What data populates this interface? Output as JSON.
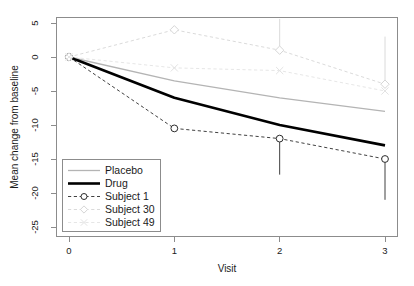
{
  "chart_data": {
    "type": "line",
    "title": "",
    "xlabel": "Visit",
    "ylabel": "Mean change from baseline",
    "x": [
      0,
      1,
      2,
      3
    ],
    "xticklabels": [
      "0",
      "1",
      "2",
      "3"
    ],
    "yticklabels": [
      "5",
      "0",
      "-5",
      "-10",
      "-15",
      "-20",
      "-25"
    ],
    "yticks": [
      5,
      0,
      -5,
      -10,
      -15,
      -20,
      -25
    ],
    "xlim": [
      -0.18,
      3.18
    ],
    "ylim": [
      -26.5,
      6.5
    ],
    "grid": false,
    "legend_position": "bottom-left-inside",
    "series": [
      {
        "name": "Placebo",
        "values": [
          0,
          -3.5,
          -6.0,
          -8.0
        ],
        "color": "#b4b4b4",
        "linestyle": "solid",
        "linewidth": 1.3,
        "marker": "none",
        "errorbars": null
      },
      {
        "name": "Drug",
        "values": [
          0,
          -6.0,
          -10.0,
          -13.0
        ],
        "color": "#000000",
        "linestyle": "solid",
        "linewidth": 2.6,
        "marker": "none",
        "errorbars": null
      },
      {
        "name": "Subject 1",
        "values": [
          0,
          -10.5,
          -12.0,
          -15.0
        ],
        "color": "#2b2b2b",
        "linestyle": "dashed",
        "linewidth": 0.9,
        "marker": "circle",
        "errorbars": [
          null,
          null,
          -17.3,
          -21.0
        ]
      },
      {
        "name": "Subject 30",
        "values": [
          0,
          4.0,
          1.0,
          -4.0
        ],
        "color": "#d6d6d6",
        "linestyle": "dashed",
        "linewidth": 0.9,
        "marker": "diamond",
        "errorbars": [
          null,
          null,
          5.6,
          3.0
        ]
      },
      {
        "name": "Subject 49",
        "values": [
          0,
          -1.6,
          -2.0,
          -5.0
        ],
        "color": "#e3e3e3",
        "linestyle": "dashed",
        "linewidth": 0.9,
        "marker": "x",
        "errorbars": null
      }
    ]
  },
  "legend": {
    "items": [
      {
        "label": "Placebo"
      },
      {
        "label": "Drug"
      },
      {
        "label": "Subject 1"
      },
      {
        "label": "Subject 30"
      },
      {
        "label": "Subject 49"
      }
    ]
  },
  "axes": {
    "x_title": "Visit",
    "y_title": "Mean change from baseline"
  }
}
